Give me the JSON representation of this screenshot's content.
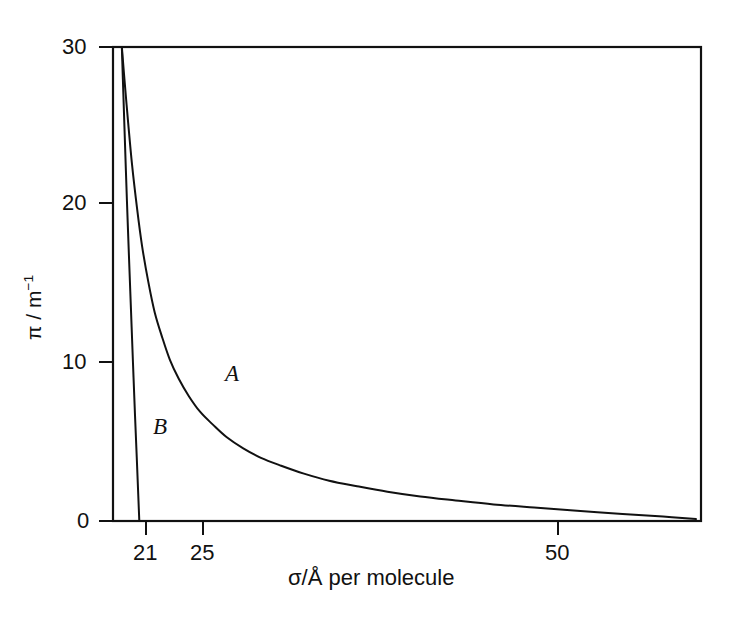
{
  "chart_data": {
    "type": "line",
    "title": "",
    "subtitle": "",
    "xlabel": "σ/Å per molecule",
    "ylabel_parts": {
      "symbol": "π / m",
      "exponent": "−1"
    },
    "ylabel": "π / m⁻¹",
    "grid": false,
    "legend_position": "inline-annotations",
    "xlim": [
      19.5,
      66
    ],
    "ylim": [
      0,
      30
    ],
    "xticks": [
      21,
      25,
      50
    ],
    "xtick_labels": [
      "21",
      "25",
      "50"
    ],
    "yticks": [
      0,
      10,
      20,
      30
    ],
    "ytick_labels": [
      "0",
      "10",
      "20",
      "30"
    ],
    "annotations": [
      {
        "text": "A",
        "x": 27.0,
        "ylevel": 9.2
      },
      {
        "text": "B",
        "x": 22.3,
        "ylevel": 5.9
      }
    ],
    "series": [
      {
        "name": "A",
        "label": "A",
        "color": "#111111",
        "description": "Real-gas-like isotherm decaying asymptotically toward zero",
        "x": [
          20.2,
          20.4,
          20.7,
          21.0,
          21.4,
          21.8,
          22.3,
          22.8,
          23.4,
          24.0,
          24.7,
          25.5,
          26.4,
          27.4,
          28.5,
          29.8,
          31.2,
          32.8,
          34.6,
          36.6,
          38.8,
          41.2,
          43.8,
          46.6,
          49.6,
          52.8,
          56.2,
          59.8,
          63.0,
          65.6
        ],
        "y": [
          30.0,
          28.0,
          25.2,
          22.6,
          19.8,
          17.4,
          15.1,
          13.2,
          11.6,
          10.2,
          9.0,
          7.9,
          6.9,
          6.1,
          5.3,
          4.6,
          4.0,
          3.5,
          3.0,
          2.55,
          2.2,
          1.85,
          1.55,
          1.3,
          1.05,
          0.85,
          0.65,
          0.45,
          0.28,
          0.12
        ]
      },
      {
        "name": "B",
        "label": "B",
        "color": "#111111",
        "description": "Steeply falling branch meeting the axis just beyond 21",
        "x": [
          20.2,
          20.32,
          20.46,
          20.6,
          20.76,
          20.92,
          21.08,
          21.24,
          21.38,
          21.5,
          21.58
        ],
        "y": [
          30.0,
          27.0,
          23.6,
          20.3,
          16.8,
          13.4,
          10.0,
          6.7,
          4.0,
          1.6,
          0.0
        ]
      }
    ]
  },
  "axes": {
    "ytick_30": "30",
    "ytick_20": "20",
    "ytick_10": "10",
    "ytick_0": "0",
    "xtick_21": "21",
    "xtick_25": "25",
    "xtick_50": "50",
    "xaxis_title": "σ/Å per molecule",
    "yaxis_symbol": "π / m",
    "yaxis_exponent": "−1"
  },
  "curve_labels": {
    "a": "A",
    "b": "B"
  }
}
